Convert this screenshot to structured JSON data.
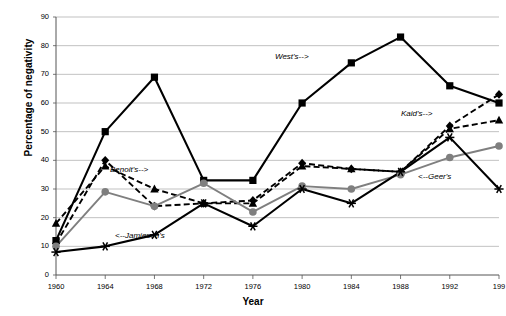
{
  "chart_data": {
    "type": "line",
    "title": "",
    "xlabel": "Year",
    "ylabel": "Percentage of negativity",
    "x": [
      1960,
      1964,
      1968,
      1972,
      1976,
      1980,
      1984,
      1988,
      1992,
      1996
    ],
    "xtick_labels": [
      "1960",
      "1964",
      "1968",
      "1972",
      "1976",
      "1980",
      "1984",
      "1988",
      "1992",
      "199"
    ],
    "ytick_labels": [
      "0",
      "10",
      "20",
      "30",
      "40",
      "50",
      "60",
      "70",
      "80",
      "90"
    ],
    "xlim": [
      1960,
      1996
    ],
    "ylim": [
      0,
      90
    ],
    "ytick_step": 10,
    "grid": "horizontal",
    "legend": "annotations-inline",
    "series": [
      {
        "name": "West's",
        "marker": "square",
        "linestyle": "solid",
        "color": "#000000",
        "values": [
          12,
          50,
          69,
          33,
          33,
          60,
          74,
          83,
          66,
          60
        ]
      },
      {
        "name": "Kaid's",
        "marker": "triangle",
        "linestyle": "dashed",
        "color": "#000000",
        "values": [
          18,
          38,
          30,
          25,
          25,
          38,
          37,
          36,
          51,
          54
        ]
      },
      {
        "name": "Benoit's",
        "marker": "diamond",
        "linestyle": "dashed",
        "color": "#000000",
        "values": [
          11,
          40,
          24,
          25,
          26,
          39,
          37,
          36,
          52,
          63
        ]
      },
      {
        "name": "Geer's",
        "marker": "circle",
        "linestyle": "solid",
        "color": "#7f7f7f",
        "values": [
          10,
          29,
          24,
          32,
          22,
          31,
          30,
          35,
          41,
          45
        ]
      },
      {
        "name": "Jamieson's",
        "marker": "star",
        "linestyle": "solid",
        "color": "#000000",
        "values": [
          8,
          10,
          14,
          25,
          17,
          30,
          25,
          36,
          48,
          30
        ]
      }
    ],
    "annotations": [
      {
        "text": "West's-->",
        "x_px": 275,
        "y_px": 52
      },
      {
        "text": "Kaid's-->",
        "x_px": 401,
        "y_px": 109
      },
      {
        "text": "Benoit's-->",
        "x_px": 110,
        "y_px": 165
      },
      {
        "text": "<--Geer's",
        "x_px": 418,
        "y_px": 172
      },
      {
        "text": "<--Jamieson's",
        "x_px": 115,
        "y_px": 231
      }
    ]
  }
}
